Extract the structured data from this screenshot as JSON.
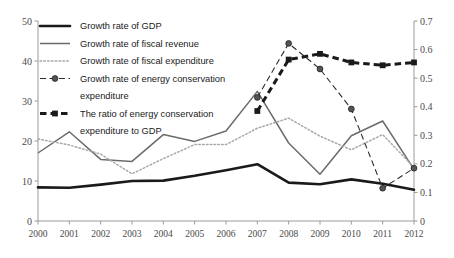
{
  "chart_data": {
    "type": "line",
    "title": "",
    "xlabel": "",
    "ylabel": "",
    "categories": [
      "2000",
      "2001",
      "2002",
      "2003",
      "2004",
      "2005",
      "2006",
      "2007",
      "2008",
      "2009",
      "2010",
      "2011",
      "2012"
    ],
    "left_axis": {
      "ticks": [
        "0",
        "10",
        "20",
        "30",
        "40",
        "50"
      ],
      "ylim": [
        0,
        50
      ],
      "label": ""
    },
    "right_axis": {
      "ticks": [
        "0",
        "0.1",
        "0.2",
        "0.3",
        "0.4",
        "0.5",
        "0.6",
        "0.7"
      ],
      "ylim": [
        0,
        0.7
      ],
      "label": ""
    },
    "grid": false,
    "legend_position": "top-left",
    "series": [
      {
        "name": "Growth rate of GDP",
        "axis": "left",
        "style": "solid-thick",
        "color": "#1a1a1a",
        "x": [
          "2000",
          "2001",
          "2002",
          "2003",
          "2004",
          "2005",
          "2006",
          "2007",
          "2008",
          "2009",
          "2010",
          "2011",
          "2012"
        ],
        "values": [
          8.4,
          8.3,
          9.1,
          10.0,
          10.1,
          11.3,
          12.7,
          14.2,
          9.6,
          9.2,
          10.4,
          9.3,
          7.8
        ]
      },
      {
        "name": "Growth rate of fiscal revenue",
        "axis": "left",
        "style": "solid-thin",
        "color": "#6b6b6b",
        "x": [
          "2000",
          "2001",
          "2002",
          "2003",
          "2004",
          "2005",
          "2006",
          "2007",
          "2008",
          "2009",
          "2010",
          "2011",
          "2012"
        ],
        "values": [
          17.0,
          22.3,
          15.4,
          14.9,
          21.6,
          19.9,
          22.5,
          32.4,
          19.5,
          11.7,
          21.3,
          25.0,
          12.9
        ]
      },
      {
        "name": "Growth rate of fiscal expenditure",
        "axis": "left",
        "style": "dotted-thin",
        "color": "#a8a8a8",
        "x": [
          "2000",
          "2001",
          "2002",
          "2003",
          "2004",
          "2005",
          "2006",
          "2007",
          "2008",
          "2009",
          "2010",
          "2011",
          "2012"
        ],
        "values": [
          20.5,
          19.0,
          16.7,
          11.8,
          15.6,
          19.1,
          19.1,
          23.2,
          25.7,
          21.2,
          17.8,
          21.6,
          13.4
        ]
      },
      {
        "name": "Growth rate of energy conservation expenditure",
        "axis": "left",
        "style": "dashed-marker",
        "color": "#2b2b2b",
        "x": [
          "2007",
          "2008",
          "2009",
          "2010",
          "2011",
          "2012"
        ],
        "values": [
          30.9,
          44.4,
          38.0,
          28.0,
          8.2,
          13.2
        ]
      },
      {
        "name": "The ratio of energy conservation expenditure to GDP",
        "axis": "right",
        "style": "dotted-thick-marker",
        "color": "#1a1a1a",
        "x": [
          "2007",
          "2008",
          "2009",
          "2010",
          "2011",
          "2012"
        ],
        "values": [
          0.385,
          0.565,
          0.585,
          0.555,
          0.545,
          0.555
        ]
      }
    ]
  },
  "legend": {
    "items": [
      {
        "label": "Growth rate of GDP",
        "marker": "solid-thick"
      },
      {
        "label": "Growth rate of fiscal revenue",
        "marker": "solid-thin"
      },
      {
        "label": "Growth rate of fiscal expenditure",
        "marker": "dotted-thin"
      },
      {
        "label": "Growth rate of energy conservation",
        "marker": "dashed-marker"
      },
      {
        "label": "expenditure",
        "marker": "none"
      },
      {
        "label": "The ratio of energy conservation",
        "marker": "dotted-thick-marker"
      },
      {
        "label": "expenditure to GDP",
        "marker": "none"
      }
    ]
  }
}
